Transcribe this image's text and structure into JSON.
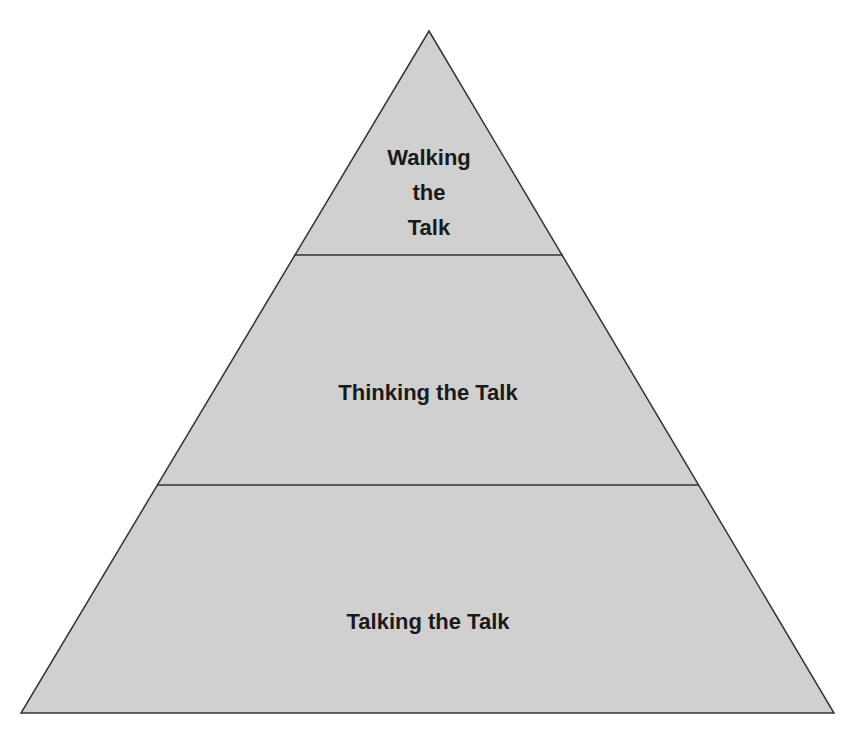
{
  "diagram": {
    "type": "pyramid",
    "colors": {
      "fill": "#d0d0d0",
      "stroke": "#333333",
      "text": "#1a1a1a",
      "background": "#ffffff"
    },
    "tiers": [
      {
        "position": "top",
        "label": "Walking the Talk",
        "lines": [
          "Walking",
          "the",
          "Talk"
        ]
      },
      {
        "position": "middle",
        "label": "Thinking the Talk"
      },
      {
        "position": "bottom",
        "label": "Talking the Talk"
      }
    ]
  }
}
